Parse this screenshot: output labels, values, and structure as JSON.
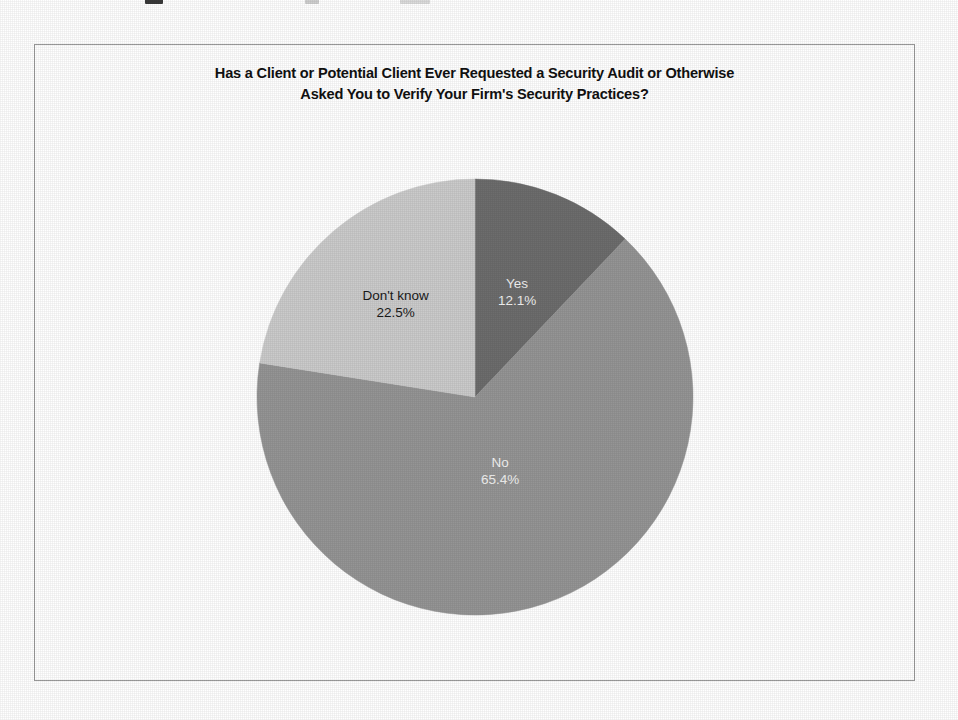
{
  "figure": {
    "title_line_1": "Has a Client or Potential Client Ever Requested a Security Audit or Otherwise",
    "title_line_2": "Asked You to Verify Your Firm's Security Practices?",
    "frame_border_color": "#9a9a9a",
    "background_color": "#ffffff"
  },
  "chart_data": {
    "type": "pie",
    "title": "Has a Client or Potential Client Ever Requested a Security Audit or Otherwise Asked You to Verify Your Firm's Security Practices?",
    "xlabel": "",
    "ylabel": "",
    "legend_position": "none",
    "grid": false,
    "start_angle_deg": 90,
    "direction": "clockwise",
    "categories": [
      "Yes",
      "No",
      "Don't know"
    ],
    "values": [
      12.1,
      65.4,
      22.5
    ],
    "unit": "percent",
    "slices": [
      {
        "label": "Yes",
        "value": 12.1,
        "value_text": "12.1%",
        "color": "#6d6d6d",
        "label_color": "#f0f0f0",
        "sweep_deg": 43.56
      },
      {
        "label": "No",
        "value": 65.4,
        "value_text": "65.4%",
        "color": "#959595",
        "label_color": "#f2f2f2",
        "sweep_deg": 235.44
      },
      {
        "label": "Don't know",
        "value": 22.5,
        "value_text": "22.5%",
        "color": "#cbcbcb",
        "label_color": "#1a1a1a",
        "sweep_deg": 81.0
      }
    ]
  }
}
